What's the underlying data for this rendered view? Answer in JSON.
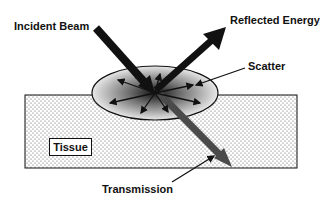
{
  "diagram": {
    "labels": {
      "incident": "Incident Beam",
      "reflected": "Reflected Energy",
      "scatter": "Scatter",
      "tissue": "Tissue",
      "transmission": "Transmission"
    },
    "colors": {
      "arrow": "#111111",
      "transmission_arrow": "#4a4a4a",
      "scatter_zone_light": "#e6e6e6",
      "scatter_zone_dark": "#1a1a1a",
      "tissue_dots": "#555555"
    }
  }
}
